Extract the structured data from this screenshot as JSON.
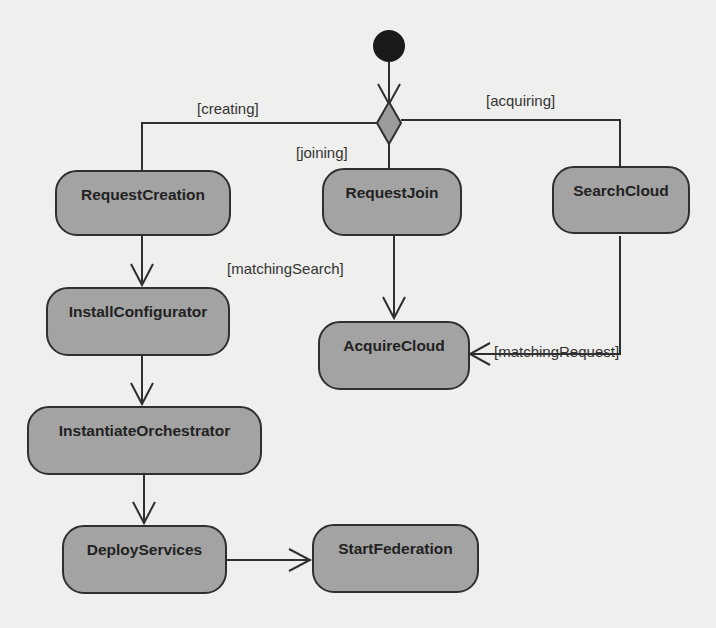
{
  "diagram": {
    "type": "UML activity diagram",
    "colors": {
      "background": "#efefed",
      "node_fill": "#a3a3a3",
      "stroke": "#2f2f2f",
      "initial_node": "#1a1a1a",
      "decision_fill": "#9c9c9c"
    },
    "initial_node": {
      "id": "start"
    },
    "decision_node": {
      "id": "decision"
    },
    "nodes": [
      {
        "id": "request_creation",
        "label": "RequestCreation"
      },
      {
        "id": "request_join",
        "label": "RequestJoin"
      },
      {
        "id": "search_cloud",
        "label": "SearchCloud"
      },
      {
        "id": "install_configurator",
        "label": "InstallConfigurator"
      },
      {
        "id": "acquire_cloud",
        "label": "AcquireCloud"
      },
      {
        "id": "instantiate_orchestrator",
        "label": "InstantiateOrchestrator"
      },
      {
        "id": "deploy_services",
        "label": "DeployServices"
      },
      {
        "id": "start_federation",
        "label": "StartFederation"
      }
    ],
    "guards": {
      "creating": "[creating]",
      "joining": "[joining]",
      "acquiring": "[acquiring]",
      "matching_search": "[matchingSearch]",
      "matching_request": "[matchingRequest]"
    },
    "edges": [
      {
        "from": "start",
        "to": "decision"
      },
      {
        "from": "decision",
        "to": "request_creation",
        "guard": "[creating]"
      },
      {
        "from": "decision",
        "to": "request_join",
        "guard": "[joining]"
      },
      {
        "from": "decision",
        "to": "search_cloud",
        "guard": "[acquiring]"
      },
      {
        "from": "request_creation",
        "to": "install_configurator"
      },
      {
        "from": "install_configurator",
        "to": "instantiate_orchestrator"
      },
      {
        "from": "instantiate_orchestrator",
        "to": "deploy_services"
      },
      {
        "from": "deploy_services",
        "to": "start_federation"
      },
      {
        "from": "request_join",
        "to": "acquire_cloud",
        "guard": "[matchingSearch]"
      },
      {
        "from": "search_cloud",
        "to": "acquire_cloud",
        "guard": "[matchingRequest]"
      }
    ]
  }
}
